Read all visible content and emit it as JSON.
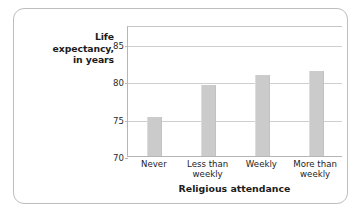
{
  "chart_data": {
    "type": "bar",
    "title": "",
    "xlabel": "Religious attendance",
    "ylabel": "Life expectancy, in years",
    "ylabel_lines": [
      "Life",
      "expectancy,",
      "in years"
    ],
    "categories": [
      "Never",
      "Less than weekly",
      "Weekly",
      "More than weekly"
    ],
    "category_lines": [
      [
        "Never"
      ],
      [
        "Less than",
        "weekly"
      ],
      [
        "Weekly"
      ],
      [
        "More than",
        "weekly"
      ]
    ],
    "values": [
      75.2,
      79.5,
      80.8,
      81.3
    ],
    "ylim": [
      70,
      87.5
    ],
    "yticks": [
      70,
      75,
      80,
      85
    ],
    "ytick_labels": [
      "70",
      "75",
      "80",
      "85"
    ],
    "grid": true,
    "legend": "none",
    "bar_color": "#cbcbcb",
    "axis_color": "#b6b6b6",
    "grid_color": "#cfcfcf",
    "frame_color": "#bdbdbd",
    "text_color": "#1c1c1c"
  }
}
